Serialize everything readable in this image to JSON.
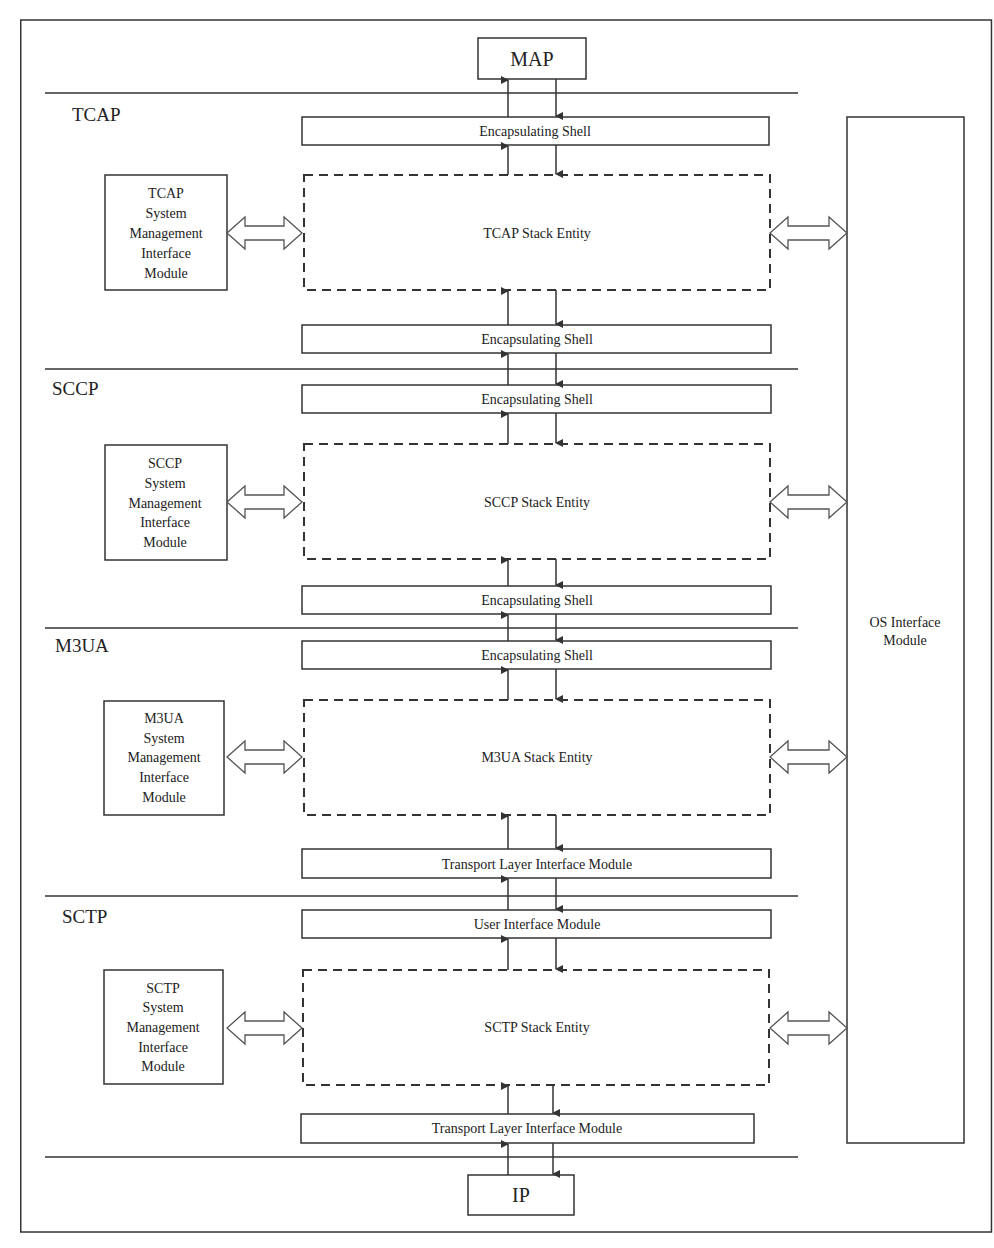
{
  "diagram": {
    "top_node": "MAP",
    "bottom_node": "IP",
    "os_module": [
      "OS Interface",
      "Module"
    ],
    "layers": [
      {
        "name": "TCAP",
        "upper_shell": "Encapsulating Shell",
        "entity": "TCAP Stack Entity",
        "lower_shell": "Encapsulating Shell",
        "mgmt": [
          "TCAP",
          "System",
          "Management",
          "Interface",
          "Module"
        ]
      },
      {
        "name": "SCCP",
        "upper_shell": "Encapsulating Shell",
        "entity": "SCCP Stack Entity",
        "lower_shell": "Encapsulating Shell",
        "mgmt": [
          "SCCP",
          "System",
          "Management",
          "Interface",
          "Module"
        ]
      },
      {
        "name": "M3UA",
        "upper_shell": "Encapsulating Shell",
        "entity": "M3UA Stack Entity",
        "lower_shell": "Transport Layer Interface Module",
        "mgmt": [
          "M3UA",
          "System",
          "Management",
          "Interface",
          "Module"
        ]
      },
      {
        "name": "SCTP",
        "upper_shell": "User Interface Module",
        "entity": "SCTP Stack Entity",
        "lower_shell": "Transport Layer Interface Module",
        "mgmt": [
          "SCTP",
          "System",
          "Management",
          "Interface",
          "Module"
        ]
      }
    ]
  }
}
